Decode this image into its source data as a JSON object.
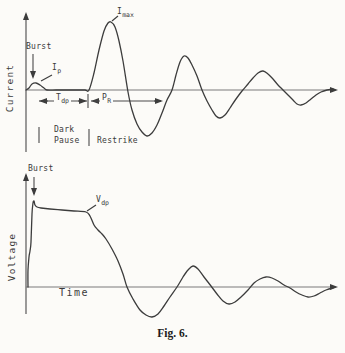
{
  "figure": {
    "caption": "Fig. 6."
  },
  "panels": {
    "current": {
      "ylabel": "Current",
      "labels": {
        "burst": "Burst",
        "ip": {
          "main": "I",
          "sub": "p"
        },
        "imax": {
          "main": "I",
          "sub": "max"
        },
        "tdp": {
          "main": "T",
          "sub": "dp"
        },
        "pr": {
          "main": "P",
          "sub": "R"
        },
        "dark_pause_line1": "Dark",
        "dark_pause_line2": "Pause",
        "restrike": "Restrike"
      }
    },
    "voltage": {
      "ylabel": "Voltage",
      "xlabel": "Time",
      "labels": {
        "burst": "Burst",
        "vdp": {
          "main": "V",
          "sub": "dp"
        }
      }
    }
  },
  "colors": {
    "bg": "#fcfbf8",
    "ink": "#3a3a3a",
    "curve": "#3c3c3c",
    "axis": "#7a7a7a",
    "yaxis": "#4a4a4a",
    "arrow": "#3c3c3c"
  },
  "chart_data": [
    {
      "type": "line",
      "panel": "current",
      "ylabel": "Current",
      "xlabel": "",
      "axis_tick_labels": [],
      "annotations": [
        "Burst",
        "I_p",
        "I_max",
        "T_dp",
        "P_R",
        "Dark Pause",
        "Restrike"
      ],
      "description_of_trace": "small burst peak I_p, flat dark pause T_dp, then large damped oscillation starting at restrike with first peak I_max",
      "baseline_y_px": 90,
      "x_range_px": [
        26,
        336
      ],
      "series": [
        {
          "name": "current",
          "points_px": [
            [
              26,
              90
            ],
            [
              29,
              88
            ],
            [
              32,
              84
            ],
            [
              36,
              83
            ],
            [
              40,
              85
            ],
            [
              44,
              88
            ],
            [
              47,
              90
            ],
            [
              56,
              90
            ],
            [
              66,
              90
            ],
            [
              76,
              90
            ],
            [
              85,
              90
            ],
            [
              89,
              90
            ],
            [
              94,
              73
            ],
            [
              99,
              50
            ],
            [
              104,
              31
            ],
            [
              108,
              23
            ],
            [
              111,
              22
            ],
            [
              115,
              27
            ],
            [
              119,
              41
            ],
            [
              123,
              61
            ],
            [
              128,
              92
            ],
            [
              132,
              110
            ],
            [
              137,
              124
            ],
            [
              142,
              132
            ],
            [
              147,
              136
            ],
            [
              152,
              133
            ],
            [
              157,
              125
            ],
            [
              162,
              113
            ],
            [
              167,
              100
            ],
            [
              172,
              90
            ],
            [
              176,
              75
            ],
            [
              180,
              62
            ],
            [
              184,
              56
            ],
            [
              188,
              58
            ],
            [
              192,
              65
            ],
            [
              197,
              76
            ],
            [
              202,
              90
            ],
            [
              207,
              101
            ],
            [
              212,
              110
            ],
            [
              216,
              116
            ],
            [
              220,
              118
            ],
            [
              225,
              115
            ],
            [
              230,
              108
            ],
            [
              236,
              99
            ],
            [
              242,
              91
            ],
            [
              248,
              84
            ],
            [
              253,
              78
            ],
            [
              258,
              73
            ],
            [
              263,
              71
            ],
            [
              268,
              74
            ],
            [
              273,
              79
            ],
            [
              278,
              85
            ],
            [
              283,
              90
            ],
            [
              288,
              95
            ],
            [
              293,
              100
            ],
            [
              297,
              104
            ],
            [
              301,
              105
            ],
            [
              306,
              103
            ],
            [
              311,
              99
            ],
            [
              316,
              95
            ],
            [
              321,
              92
            ],
            [
              327,
              90
            ],
            [
              333,
              89
            ]
          ]
        }
      ]
    },
    {
      "type": "line",
      "panel": "voltage",
      "ylabel": "Voltage",
      "xlabel": "Time",
      "axis_tick_labels": [],
      "annotations": [
        "Burst",
        "V_dp"
      ],
      "description_of_trace": "sharp burst spike, long slightly-drooping plateau V_dp, then decay into damped oscillation about the time axis",
      "baseline_y_px": 287,
      "x_range_px": [
        26,
        336
      ],
      "series": [
        {
          "name": "voltage",
          "points_px": [
            [
              28,
              287
            ],
            [
              28,
              270
            ],
            [
              29,
              257
            ],
            [
              30,
              251
            ],
            [
              31,
              242
            ],
            [
              32,
              214
            ],
            [
              33,
              203
            ],
            [
              34,
              201
            ],
            [
              35,
              205
            ],
            [
              37,
              207
            ],
            [
              41,
              208
            ],
            [
              50,
              209
            ],
            [
              62,
              210
            ],
            [
              74,
              211
            ],
            [
              86,
              212
            ],
            [
              90,
              216
            ],
            [
              94,
              225
            ],
            [
              98,
              230
            ],
            [
              102,
              234
            ],
            [
              106,
              239
            ],
            [
              112,
              249
            ],
            [
              118,
              261
            ],
            [
              123,
              274
            ],
            [
              127,
              287
            ],
            [
              133,
              299
            ],
            [
              140,
              310
            ],
            [
              146,
              315
            ],
            [
              152,
              317
            ],
            [
              158,
              314
            ],
            [
              164,
              306
            ],
            [
              170,
              297
            ],
            [
              177,
              287
            ],
            [
              183,
              277
            ],
            [
              188,
              270
            ],
            [
              193,
              266
            ],
            [
              198,
              269
            ],
            [
              204,
              277
            ],
            [
              211,
              286
            ],
            [
              217,
              294
            ],
            [
              223,
              301
            ],
            [
              229,
              304
            ],
            [
              235,
              302
            ],
            [
              241,
              297
            ],
            [
              248,
              290
            ],
            [
              254,
              283
            ],
            [
              260,
              279
            ],
            [
              266,
              277
            ],
            [
              272,
              278
            ],
            [
              278,
              281
            ],
            [
              284,
              285
            ],
            [
              290,
              288
            ],
            [
              296,
              292
            ],
            [
              302,
              295
            ],
            [
              308,
              297
            ],
            [
              314,
              296
            ],
            [
              320,
              293
            ],
            [
              326,
              290
            ],
            [
              333,
              288
            ]
          ]
        }
      ]
    }
  ],
  "render": {
    "lines": [
      {
        "name": "current-y-axis",
        "x1": 26,
        "y1": 152,
        "x2": 26,
        "y2": 14,
        "arrow": true,
        "stroke": "yaxis"
      },
      {
        "name": "current-x-axis",
        "x1": 26,
        "y1": 90,
        "x2": 336,
        "y2": 90,
        "arrow": true,
        "stroke": "axis"
      },
      {
        "name": "current-burst-arrow",
        "x1": 33,
        "y1": 54,
        "x2": 33,
        "y2": 77,
        "arrow": true,
        "stroke": "yaxis"
      },
      {
        "name": "ip-leader",
        "x1": 52,
        "y1": 75,
        "x2": 41,
        "y2": 81,
        "arrow": false,
        "stroke": "curve"
      },
      {
        "name": "imax-leader",
        "x1": 118,
        "y1": 16,
        "x2": 112,
        "y2": 21,
        "arrow": false,
        "stroke": "curve"
      },
      {
        "name": "tdp-dim-line",
        "x1": 39,
        "y1": 101,
        "x2": 87,
        "y2": 101,
        "arrow": false,
        "stroke": "yaxis"
      },
      {
        "name": "tdp-arrow-left",
        "x1": 48,
        "y1": 101,
        "x2": 41,
        "y2": 101,
        "arrow": true,
        "stroke": "yaxis"
      },
      {
        "name": "tdp-arrow-right",
        "x1": 78,
        "y1": 101,
        "x2": 85,
        "y2": 101,
        "arrow": true,
        "stroke": "yaxis"
      },
      {
        "name": "dim-separator-bar",
        "x1": 88,
        "y1": 94,
        "x2": 88,
        "y2": 108,
        "arrow": false,
        "stroke": "yaxis"
      },
      {
        "name": "pr-arrow-left",
        "x1": 98,
        "y1": 101,
        "x2": 93,
        "y2": 101,
        "arrow": true,
        "stroke": "yaxis"
      },
      {
        "name": "pr-dim-line",
        "x1": 91,
        "y1": 101,
        "x2": 161,
        "y2": 101,
        "arrow": false,
        "stroke": "yaxis"
      },
      {
        "name": "pr-arrow-right",
        "x1": 154,
        "y1": 101,
        "x2": 161,
        "y2": 101,
        "arrow": true,
        "stroke": "yaxis"
      },
      {
        "name": "dark-pause-tick-left",
        "x1": 39,
        "y1": 127,
        "x2": 39,
        "y2": 143,
        "arrow": false,
        "stroke": "yaxis"
      },
      {
        "name": "dark-pause-tick-right",
        "x1": 89,
        "y1": 129,
        "x2": 89,
        "y2": 146,
        "arrow": false,
        "stroke": "yaxis"
      },
      {
        "name": "voltage-y-axis",
        "x1": 26,
        "y1": 314,
        "x2": 26,
        "y2": 175,
        "arrow": true,
        "stroke": "yaxis"
      },
      {
        "name": "voltage-x-axis",
        "x1": 26,
        "y1": 287,
        "x2": 336,
        "y2": 287,
        "arrow": true,
        "stroke": "axis"
      },
      {
        "name": "voltage-burst-arrow",
        "x1": 34,
        "y1": 177,
        "x2": 34,
        "y2": 194,
        "arrow": true,
        "stroke": "yaxis"
      },
      {
        "name": "vdp-leader",
        "x1": 96,
        "y1": 205,
        "x2": 87,
        "y2": 211,
        "arrow": false,
        "stroke": "curve"
      }
    ]
  }
}
